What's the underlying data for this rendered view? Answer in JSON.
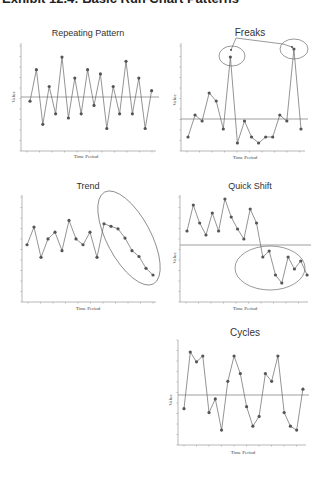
{
  "page": {
    "title": "Exhibit 12.4: Basic Run Chart Patterns"
  },
  "style": {
    "line_color": "#666666",
    "marker_color": "#555555",
    "axis_color": "#888888",
    "ellipse_color": "#555555"
  },
  "chart_data": [
    {
      "id": "repeating",
      "type": "line",
      "title": "Repeating Pattern",
      "xlabel": "Time Period",
      "ylabel": "Value",
      "grid": false,
      "center_line": 0,
      "x": [
        1,
        2,
        3,
        4,
        5,
        6,
        7,
        8,
        9,
        10,
        11,
        12,
        13,
        14,
        15,
        16,
        17,
        18,
        19,
        20
      ],
      "values": [
        -1.0,
        6.5,
        -6.5,
        2.5,
        -4.0,
        9.5,
        -5.0,
        4.5,
        -4.0,
        6.5,
        -2.0,
        5.5,
        -7.5,
        2.5,
        -4.0,
        8.5,
        -4.0,
        4.5,
        -7.5,
        1.5
      ],
      "annotations": [],
      "box": {
        "x0": 21,
        "x1": 156,
        "y_top": 43,
        "y_axis": 151,
        "y_center": 97,
        "px_per_unit": 4.2,
        "x_first": 30,
        "x_step": 6.4
      },
      "title_pos": [
        88,
        36
      ],
      "xlabel_pos": [
        86,
        158
      ],
      "ylabel_pos": [
        15,
        97
      ]
    },
    {
      "id": "freaks",
      "type": "line",
      "title": "Freaks",
      "xlabel": "Time Period",
      "ylabel": "Value",
      "grid": false,
      "center_line": 0,
      "x": [
        1,
        2,
        3,
        4,
        5,
        6,
        7,
        8,
        9,
        10,
        11,
        12,
        13,
        14,
        15,
        16,
        17
      ],
      "values": [
        -4.5,
        1.0,
        -0.5,
        6.5,
        4.5,
        -2.5,
        15.5,
        -6.0,
        -0.5,
        -4.5,
        -6.0,
        -4.5,
        -4.5,
        1.0,
        -0.5,
        17.5,
        -2.5
      ],
      "annotations": [
        {
          "type": "ellipse",
          "cx": 232,
          "cy": 56,
          "rx": 13,
          "ry": 10,
          "label": "freak-1"
        },
        {
          "type": "ellipse",
          "cx": 294,
          "cy": 49,
          "rx": 14,
          "ry": 10,
          "label": "freak-2"
        }
      ],
      "box": {
        "x0": 181,
        "x1": 305,
        "y_top": 43,
        "y_axis": 151,
        "y_center": 119,
        "px_per_unit": 4.0,
        "x_first": 188,
        "x_step": 7.06
      },
      "title_pos": [
        250,
        36
      ],
      "xlabel_pos": [
        245,
        159
      ],
      "ylabel_pos": [
        176,
        100
      ]
    },
    {
      "id": "trend",
      "type": "line",
      "title": "Trend",
      "xlabel": "Time Period",
      "ylabel": "",
      "grid": false,
      "center_line": null,
      "x": [
        1,
        2,
        3,
        4,
        5,
        6,
        7,
        8,
        9,
        10,
        11,
        12,
        13,
        14,
        15,
        16,
        17,
        18,
        19
      ],
      "values": [
        61,
        82,
        46,
        68,
        76,
        54,
        90,
        68,
        61,
        76,
        46,
        86,
        83,
        80,
        69,
        54,
        47,
        33,
        25
      ],
      "annotations": [
        {
          "type": "ellipse",
          "cx": 129,
          "cy": 238,
          "rx": 22,
          "ry": 52,
          "rotate": -28,
          "label": "downward-trend"
        }
      ],
      "box": {
        "x0": 22,
        "x1": 156,
        "y_top": 195,
        "y_axis": 302,
        "y_min": 0,
        "y_max": 100,
        "x_first": 27,
        "x_step": 7.0,
        "px_top": 300,
        "px_scale": 1.0
      },
      "title_pos": [
        88,
        189
      ],
      "xlabel_pos": [
        88,
        310
      ],
      "ylabel_pos": [
        15,
        248
      ]
    },
    {
      "id": "quick-shift",
      "type": "line",
      "title": "Quick Shift",
      "xlabel": "Time Period",
      "ylabel": "Value",
      "grid": false,
      "center_line": 0,
      "x": [
        1,
        2,
        3,
        4,
        5,
        6,
        7,
        8,
        9,
        10,
        11,
        12,
        13,
        14,
        15,
        16,
        17,
        18,
        19,
        20
      ],
      "values": [
        3.5,
        10.0,
        5.5,
        2.5,
        8.0,
        3.5,
        11.5,
        7.0,
        4.0,
        1.5,
        9.0,
        5.5,
        -3.0,
        -1.5,
        -7.5,
        -9.5,
        -3.0,
        -6.0,
        -4.0,
        -7.5
      ],
      "annotations": [
        {
          "type": "ellipse",
          "cx": 270,
          "cy": 268,
          "rx": 35,
          "ry": 22,
          "label": "shift-region"
        }
      ],
      "box": {
        "x0": 180,
        "x1": 308,
        "y_top": 195,
        "y_axis": 302,
        "y_center": 245,
        "px_per_unit": 4.0,
        "x_first": 187,
        "x_step": 6.32
      },
      "title_pos": [
        250,
        189
      ],
      "xlabel_pos": [
        245,
        310
      ],
      "ylabel_pos": [
        176,
        258
      ]
    },
    {
      "id": "cycles",
      "type": "line",
      "title": "Cycles",
      "xlabel": "Time Period",
      "ylabel": "Value",
      "grid": false,
      "center_line": 0,
      "x": [
        1,
        2,
        3,
        4,
        5,
        6,
        7,
        8,
        9,
        10,
        11,
        12,
        13,
        14,
        15,
        16,
        17,
        18,
        19,
        20
      ],
      "values": [
        -3.5,
        11.0,
        8.5,
        10.0,
        -4.5,
        -1.0,
        -9.0,
        3.5,
        10.0,
        5.5,
        -3.0,
        -8.0,
        -5.5,
        5.5,
        3.5,
        10.0,
        -4.5,
        -8.0,
        -9.0,
        1.5
      ],
      "annotations": [],
      "box": {
        "x0": 178,
        "x1": 306,
        "y_top": 340,
        "y_axis": 445,
        "y_center": 395,
        "px_per_unit": 3.9,
        "x_first": 184,
        "x_step": 6.26
      },
      "title_pos": [
        245,
        336
      ],
      "xlabel_pos": [
        243,
        454
      ],
      "ylabel_pos": [
        172,
        400
      ]
    }
  ],
  "freaks_leader": {
    "points": [
      [
        231,
        50
      ],
      [
        236,
        38
      ],
      [
        283,
        44
      ],
      [
        292,
        47
      ]
    ]
  }
}
